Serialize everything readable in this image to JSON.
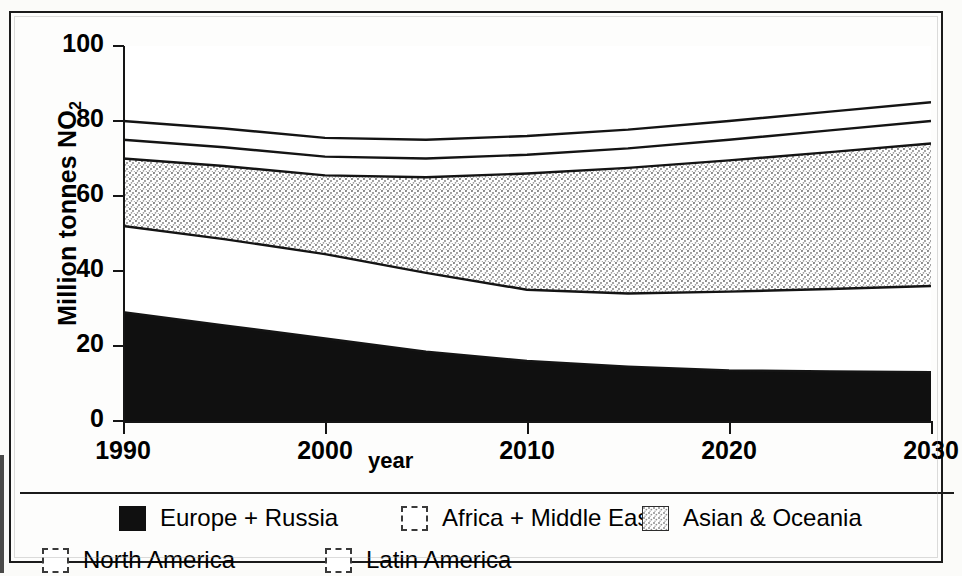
{
  "chart_data": {
    "type": "area",
    "title": "",
    "subtitle": "",
    "xlabel": "year",
    "ylabel": "Million tonnes NO2",
    "ylabel_display": "Million tonnes NO",
    "ylabel_sub": "2",
    "xlim": [
      1990,
      2030
    ],
    "ylim": [
      0,
      100
    ],
    "grid": false,
    "stacked": true,
    "legend_position": "bottom",
    "x_ticks": [
      "1990",
      "2000",
      "2010",
      "2020",
      "2030"
    ],
    "x_tick_values": [
      1990,
      2000,
      2010,
      2020,
      2030
    ],
    "y_ticks": [
      "0",
      "20",
      "40",
      "60",
      "80",
      "100"
    ],
    "y_tick_values": [
      0,
      20,
      40,
      60,
      80,
      100
    ],
    "x": [
      1990,
      1995,
      2000,
      2005,
      2010,
      2015,
      2020,
      2025,
      2030
    ],
    "series": [
      {
        "name": "Europe + Russia",
        "fill": "solid-black",
        "color": "#101010",
        "values": [
          29.0,
          25.5,
          22.0,
          18.5,
          16.0,
          14.5,
          13.5,
          13.2,
          13.0
        ]
      },
      {
        "name": "North America",
        "fill": "white",
        "color": "#ffffff",
        "values": [
          23.0,
          23.0,
          22.5,
          21.0,
          19.0,
          19.5,
          21.0,
          22.0,
          23.0
        ]
      },
      {
        "name": "Asian & Oceania",
        "fill": "stipple-gray",
        "color": "#b9b9b9",
        "values": [
          18.0,
          19.5,
          21.0,
          25.5,
          31.0,
          33.5,
          35.0,
          36.5,
          38.0
        ]
      },
      {
        "name": "Africa + Middle East",
        "fill": "white",
        "color": "#ffffff",
        "values": [
          5.0,
          5.0,
          5.0,
          5.0,
          5.0,
          5.2,
          5.5,
          5.8,
          6.0
        ]
      },
      {
        "name": "Latin America",
        "fill": "white",
        "color": "#ffffff",
        "values": [
          5.0,
          5.0,
          5.0,
          5.0,
          5.0,
          5.0,
          5.0,
          5.0,
          5.0
        ]
      }
    ],
    "cumulative_tops": {
      "Europe + Russia": [
        29.0,
        25.5,
        22.0,
        18.5,
        16.0,
        14.5,
        13.5,
        13.2,
        13.0
      ],
      "North America": [
        52.0,
        48.5,
        44.5,
        39.5,
        35.0,
        34.0,
        34.5,
        35.2,
        36.0
      ],
      "Asian & Oceania": [
        70.0,
        68.0,
        65.5,
        65.0,
        66.0,
        67.5,
        69.5,
        71.7,
        74.0
      ],
      "Africa + Middle East": [
        75.0,
        73.0,
        70.5,
        70.0,
        71.0,
        72.7,
        75.0,
        77.5,
        80.0
      ],
      "Latin America": [
        80.0,
        78.0,
        75.5,
        75.0,
        76.0,
        77.7,
        80.0,
        82.5,
        85.0
      ]
    },
    "legend_entries": [
      {
        "label": "Europe + Russia",
        "swatch": "solid-black"
      },
      {
        "label": "Africa + Middle East",
        "swatch": "white-dashed"
      },
      {
        "label": "Asian & Oceania",
        "swatch": "stipple-gray"
      },
      {
        "label": "North America",
        "swatch": "white-dashed"
      },
      {
        "label": "Latin America",
        "swatch": "white-dashed"
      }
    ]
  },
  "axes": {
    "ylabel_main": "Million tonnes NO",
    "ylabel_subscript": "2",
    "xlabel": "year",
    "y_ticks": [
      "100",
      "80",
      "60",
      "40",
      "20",
      "0"
    ],
    "x_ticks": [
      "1990",
      "2000",
      "2010",
      "2020",
      "2030"
    ]
  },
  "legend": {
    "row1": [
      {
        "label": "Europe + Russia",
        "swatch": "solid-black"
      },
      {
        "label": "Africa + Middle East",
        "swatch": "white-dashed"
      },
      {
        "label": "Asian & Oceania",
        "swatch": "stipple-gray"
      }
    ],
    "row2": [
      {
        "label": "North America",
        "swatch": "white-dashed"
      },
      {
        "label": "Latin America",
        "swatch": "white-dashed"
      }
    ]
  },
  "colors": {
    "ink": "#101010",
    "stipple": "#b9b9b9",
    "paper": "#fdfdfc",
    "frame": "#1b1b1b"
  }
}
